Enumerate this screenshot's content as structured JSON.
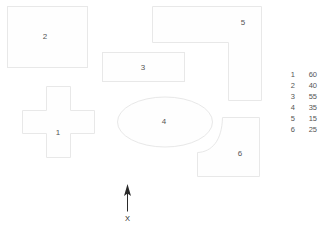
{
  "diagram": {
    "background_color": "#ffffff",
    "shape_fill_color": "#fefefe",
    "shape_stroke_color": "#e8e8e8",
    "label_color": "#555555",
    "arrow_color": "#2a2a2a"
  },
  "shapes": [
    {
      "id": "zone-1",
      "label": "1",
      "form": "cross",
      "label_x": 58,
      "label_y": 133
    },
    {
      "id": "zone-2",
      "label": "2",
      "form": "rectangle",
      "label_x": 45,
      "label_y": 37
    },
    {
      "id": "zone-3",
      "label": "3",
      "form": "rectangle",
      "label_x": 143,
      "label_y": 68
    },
    {
      "id": "zone-4",
      "label": "4",
      "form": "ellipse",
      "label_x": 164,
      "label_y": 122
    },
    {
      "id": "zone-5",
      "label": "5",
      "form": "l-shape",
      "label_x": 243,
      "label_y": 23
    },
    {
      "id": "zone-6",
      "label": "6",
      "form": "rectangle-with-concave-corner",
      "label_x": 240,
      "label_y": 154
    }
  ],
  "legend": {
    "rows": [
      {
        "key": "1",
        "value": "60"
      },
      {
        "key": "2",
        "value": "40"
      },
      {
        "key": "3",
        "value": "55"
      },
      {
        "key": "4",
        "value": "35"
      },
      {
        "key": "5",
        "value": "15"
      },
      {
        "key": "6",
        "value": "25"
      }
    ]
  },
  "orientation": {
    "icon": "up-arrow-icon",
    "label": "X"
  }
}
